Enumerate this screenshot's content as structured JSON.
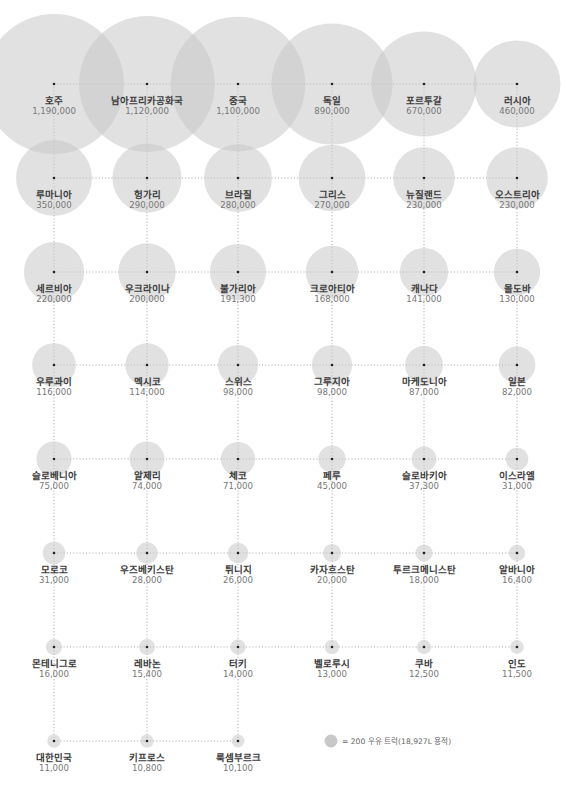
{
  "chart_data": {
    "type": "bubble-grid",
    "title": "",
    "legend": {
      "text": "= 200 우유 트럭(18,927L 용적)",
      "unit_value": 200,
      "placement": "bottom-right"
    },
    "columns": 6,
    "colors": {
      "bubble": "#c8c8c8",
      "grid": "#9a9a9a",
      "dot": "#222222",
      "name": "#3a3a3a",
      "value": "#777777"
    },
    "items": [
      {
        "name": "호주",
        "value": 1190000,
        "value_label": "1,190,000"
      },
      {
        "name": "남아프리카공화국",
        "value": 1120000,
        "value_label": "1,120,000"
      },
      {
        "name": "중국",
        "value": 1100000,
        "value_label": "1,100,000"
      },
      {
        "name": "독일",
        "value": 890000,
        "value_label": "890,000"
      },
      {
        "name": "포르투갈",
        "value": 670000,
        "value_label": "670,000"
      },
      {
        "name": "러시아",
        "value": 460000,
        "value_label": "460,000"
      },
      {
        "name": "루마니아",
        "value": 350000,
        "value_label": "350,000"
      },
      {
        "name": "헝가리",
        "value": 290000,
        "value_label": "290,000"
      },
      {
        "name": "브라질",
        "value": 280000,
        "value_label": "280,000"
      },
      {
        "name": "그리스",
        "value": 270000,
        "value_label": "270,000"
      },
      {
        "name": "뉴질랜드",
        "value": 230000,
        "value_label": "230,000"
      },
      {
        "name": "오스트리아",
        "value": 230000,
        "value_label": "230,000"
      },
      {
        "name": "세르비아",
        "value": 220000,
        "value_label": "220,000"
      },
      {
        "name": "우크라이나",
        "value": 200000,
        "value_label": "200,000"
      },
      {
        "name": "불가리아",
        "value": 191300,
        "value_label": "191,300"
      },
      {
        "name": "크로아티아",
        "value": 168000,
        "value_label": "168,000"
      },
      {
        "name": "캐나다",
        "value": 141000,
        "value_label": "141,000"
      },
      {
        "name": "몰도바",
        "value": 130000,
        "value_label": "130,000"
      },
      {
        "name": "우루과이",
        "value": 116000,
        "value_label": "116,000"
      },
      {
        "name": "멕시코",
        "value": 114000,
        "value_label": "114,000"
      },
      {
        "name": "스위스",
        "value": 98000,
        "value_label": "98,000"
      },
      {
        "name": "그루지아",
        "value": 98000,
        "value_label": "98,000"
      },
      {
        "name": "마케도니아",
        "value": 87000,
        "value_label": "87,000"
      },
      {
        "name": "일본",
        "value": 82000,
        "value_label": "82,000"
      },
      {
        "name": "슬로베니아",
        "value": 75000,
        "value_label": "75,000"
      },
      {
        "name": "알제리",
        "value": 74000,
        "value_label": "74,000"
      },
      {
        "name": "체코",
        "value": 71000,
        "value_label": "71,000"
      },
      {
        "name": "페루",
        "value": 45000,
        "value_label": "45,000"
      },
      {
        "name": "슬로바키아",
        "value": 37300,
        "value_label": "37,300"
      },
      {
        "name": "이스라엘",
        "value": 31000,
        "value_label": "31,000"
      },
      {
        "name": "모로코",
        "value": 31000,
        "value_label": "31,000"
      },
      {
        "name": "우즈베키스탄",
        "value": 28000,
        "value_label": "28,000"
      },
      {
        "name": "튀니지",
        "value": 26000,
        "value_label": "26,000"
      },
      {
        "name": "카자흐스탄",
        "value": 20000,
        "value_label": "20,000"
      },
      {
        "name": "투르크메니스탄",
        "value": 18000,
        "value_label": "18,000"
      },
      {
        "name": "알바니아",
        "value": 16400,
        "value_label": "16,400"
      },
      {
        "name": "몬테니그로",
        "value": 16000,
        "value_label": "16,000"
      },
      {
        "name": "레바논",
        "value": 15400,
        "value_label": "15,400"
      },
      {
        "name": "터키",
        "value": 14000,
        "value_label": "14,000"
      },
      {
        "name": "벨로루시",
        "value": 13000,
        "value_label": "13,000"
      },
      {
        "name": "쿠바",
        "value": 12500,
        "value_label": "12,500"
      },
      {
        "name": "인도",
        "value": 11500,
        "value_label": "11,500"
      },
      {
        "name": "대한민국",
        "value": 11000,
        "value_label": "11,000"
      },
      {
        "name": "키프로스",
        "value": 10800,
        "value_label": "10,800"
      },
      {
        "name": "룩셈부르크",
        "value": 10100,
        "value_label": "10,100"
      }
    ]
  }
}
